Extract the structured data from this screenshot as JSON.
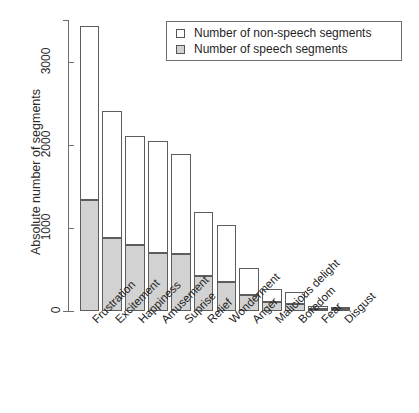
{
  "chart_data": {
    "type": "bar",
    "subtype": "stacked-vertical",
    "title": "",
    "xlabel": "",
    "ylabel": "Absolute number of segments",
    "ylim": [
      0,
      3500
    ],
    "yticks": [
      0,
      1000,
      2000,
      3000
    ],
    "ytick_labels": [
      "0",
      "1000",
      "2000",
      "3000"
    ],
    "grid": false,
    "legend_position": "top-right",
    "categories": [
      "Frustration",
      "Excitement",
      "Happiness",
      "Amusement",
      "Suprise",
      "Relief",
      "Wonderment",
      "Anger",
      "Malicious delight",
      "Boredom",
      "Fear",
      "Disgust"
    ],
    "series": [
      {
        "name": "Number of speech segments",
        "color": "#d2d2d2",
        "values": [
          1330,
          880,
          790,
          700,
          690,
          420,
          350,
          190,
          110,
          80,
          25,
          20
        ]
      },
      {
        "name": "Number of non-speech segments",
        "color": "#ffffff",
        "values": [
          2100,
          1530,
          1320,
          1340,
          1200,
          770,
          680,
          330,
          150,
          150,
          35,
          15
        ]
      }
    ],
    "totals": [
      3430,
      2410,
      2110,
      2040,
      1890,
      1190,
      1030,
      520,
      260,
      230,
      60,
      35
    ]
  },
  "legend": {
    "entries": [
      {
        "label": "Number of non-speech segments",
        "swatch": "white"
      },
      {
        "label": "Number of speech segments",
        "swatch": "gray"
      }
    ]
  },
  "colors": {
    "speech_fill": "#d2d2d2",
    "nonspeech_fill": "#ffffff",
    "outline": "#5d5d5d",
    "axis": "#6e6e6e",
    "text": "#222222"
  }
}
